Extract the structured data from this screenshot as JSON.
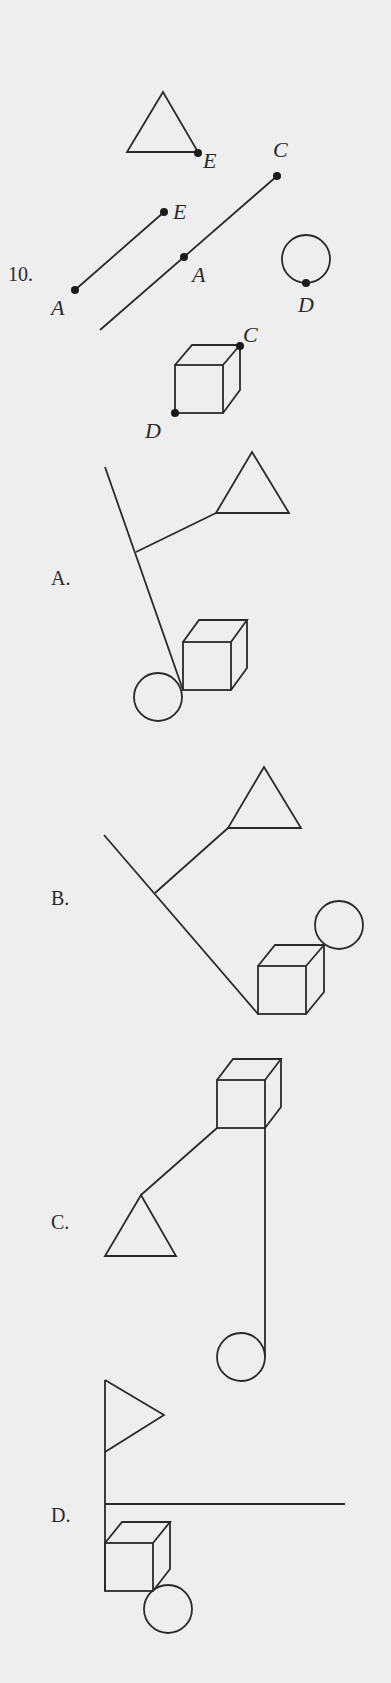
{
  "question": {
    "number": "10.",
    "point_labels": {
      "triangle_E": "E",
      "segment1_E": "E",
      "segment1_A": "A",
      "segment2_C": "C",
      "segment2_A": "A",
      "circle_D": "D",
      "cube_C": "C",
      "cube_D": "D"
    }
  },
  "options": [
    {
      "label": "A."
    },
    {
      "label": "B."
    },
    {
      "label": "C."
    },
    {
      "label": "D."
    }
  ],
  "colors": {
    "background": "#eeeeee",
    "ink": "#2a2a2a"
  }
}
